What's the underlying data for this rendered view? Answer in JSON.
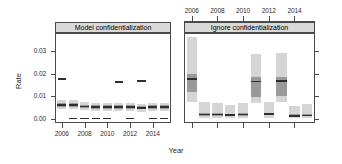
{
  "figure": {
    "ylabel": "Rate",
    "xlabel": "Year",
    "panels": [
      {
        "label": "Model confidentialization"
      },
      {
        "label": "Ignore confidentialization"
      }
    ]
  },
  "chart_data": {
    "type": "bar",
    "title": "",
    "xlabel": "Year",
    "ylabel": "Rate",
    "ylim": [
      -0.002,
      0.038
    ],
    "yticks": [
      0.0,
      0.01,
      0.02,
      0.03
    ],
    "ytick_labels": [
      "0.00",
      "0.01",
      "0.02",
      "0.03"
    ],
    "xlim": [
      2005.4,
      2015.6
    ],
    "xticks": [
      2006,
      2008,
      2010,
      2012,
      2014
    ],
    "xtick_labels": [
      "2006",
      "2008",
      "2010",
      "2012",
      "2014"
    ],
    "top_axis_ticks": [
      2006,
      2008,
      2010,
      2012,
      2014
    ],
    "top_axis_labels": [
      "2006",
      "2008",
      "2010",
      "2012",
      "2014"
    ],
    "grid": false,
    "legend": "none",
    "x": [
      2006,
      2007,
      2008,
      2009,
      2010,
      2011,
      2012,
      2013,
      2014,
      2015
    ],
    "panels": [
      {
        "name": "Model confidentialization",
        "series": [
          {
            "name": "outer-interval-low",
            "values": [
              0.004,
              0.004,
              0.0036,
              0.0032,
              0.0034,
              0.0034,
              0.0032,
              0.003,
              0.0032,
              0.0032
            ]
          },
          {
            "name": "inner-interval-low",
            "values": [
              0.0052,
              0.0052,
              0.0046,
              0.0042,
              0.0044,
              0.0044,
              0.0042,
              0.004,
              0.0042,
              0.0042
            ]
          },
          {
            "name": "median",
            "values": [
              0.006,
              0.006,
              0.0054,
              0.005,
              0.0052,
              0.0052,
              0.005,
              0.0048,
              0.005,
              0.005
            ]
          },
          {
            "name": "inner-interval-high",
            "values": [
              0.0068,
              0.0068,
              0.0062,
              0.0058,
              0.006,
              0.006,
              0.0058,
              0.0056,
              0.0058,
              0.0058
            ]
          },
          {
            "name": "outer-interval-high",
            "values": [
              0.0084,
              0.0084,
              0.0074,
              0.0068,
              0.007,
              0.007,
              0.0068,
              0.0066,
              0.0068,
              0.0068
            ]
          },
          {
            "name": "observed",
            "values": [
              0.0176,
              0.0,
              0.0,
              0.0,
              0.0,
              0.0163,
              0.0,
              0.0166,
              0.0,
              0.0
            ]
          }
        ]
      },
      {
        "name": "Ignore confidentialization",
        "series": [
          {
            "name": "outer-interval-low",
            "values": [
              0.0072,
              0.0004,
              0.0004,
              0.0002,
              0.0004,
              0.007,
              0.0004,
              0.0072,
              0.0002,
              0.0002
            ]
          },
          {
            "name": "inner-interval-low",
            "values": [
              0.0116,
              0.0012,
              0.0012,
              0.001,
              0.0012,
              0.0094,
              0.0014,
              0.01,
              0.0008,
              0.001
            ]
          },
          {
            "name": "median",
            "values": [
              0.0176,
              0.0018,
              0.0018,
              0.0016,
              0.0018,
              0.0164,
              0.002,
              0.0168,
              0.0012,
              0.0014
            ]
          },
          {
            "name": "inner-interval-high",
            "values": [
              0.0196,
              0.0024,
              0.0024,
              0.0022,
              0.0024,
              0.0184,
              0.0026,
              0.0186,
              0.0018,
              0.002
            ]
          },
          {
            "name": "outer-interval-high",
            "values": [
              0.0362,
              0.0072,
              0.0068,
              0.0058,
              0.007,
              0.0286,
              0.0072,
              0.0292,
              0.0056,
              0.0064
            ]
          }
        ]
      }
    ]
  },
  "style": {
    "outer_band_color": "#d5d5d5",
    "inner_band_color": "#9a9a9a",
    "median_color": "#2f2f2f",
    "axis_color": "#4a4a4a",
    "strip_bg": "#d9d9d9",
    "text_color": "#2b2b2b"
  }
}
